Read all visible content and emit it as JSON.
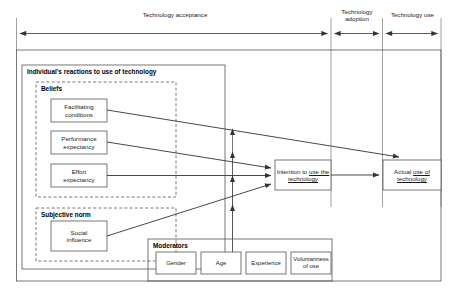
{
  "diagram": {
    "phases": [
      {
        "id": "technology-acceptance",
        "label": "Technology acceptance"
      },
      {
        "id": "technology-adoption",
        "label": "Technology\nadoption"
      },
      {
        "id": "technology-use",
        "label": "Technology use"
      }
    ],
    "groups": {
      "individual_reactions": {
        "label": "Individual's reactions to use of technology"
      },
      "beliefs": {
        "label": "Beliefs"
      },
      "subjective_norm": {
        "label": "Subjective norm"
      },
      "moderators": {
        "label": "Moderators"
      }
    },
    "beliefs_nodes": [
      {
        "id": "facilitating-conditions",
        "label": "Facilitating\nconditions"
      },
      {
        "id": "performance-expectancy",
        "label": "Performance\nexpectancy"
      },
      {
        "id": "effort-expectancy",
        "label": "Effort\nexpectancy"
      }
    ],
    "norm_nodes": [
      {
        "id": "social-influence",
        "label": "Social\ninfluence"
      }
    ],
    "outcome_nodes": [
      {
        "id": "intention-to-use",
        "label_plain": "Intention to use the technology",
        "label_prefix": "Intention to ",
        "label_underlined": "use the technology"
      },
      {
        "id": "actual-use",
        "label_plain": "Actual use of technology",
        "label_prefix": "Actual ",
        "label_underlined": "use of technology"
      }
    ],
    "moderator_nodes": [
      {
        "id": "gender",
        "label": "Gender"
      },
      {
        "id": "age",
        "label": "Age"
      },
      {
        "id": "experience",
        "label": "Experience"
      },
      {
        "id": "voluntariness-of-use",
        "label": "Voluntariness\nof use"
      }
    ],
    "colors": {
      "stroke": "#555555",
      "text": "#1a1a1a",
      "background": "#ffffff",
      "dashed": "#555555"
    }
  }
}
